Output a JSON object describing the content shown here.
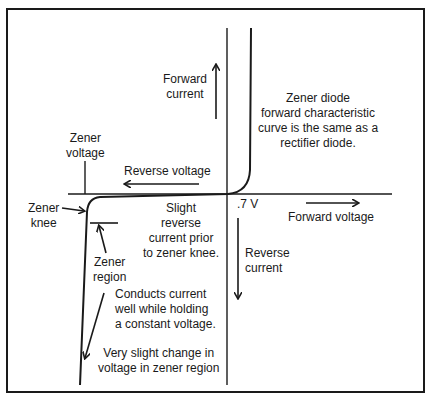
{
  "labels": {
    "forward_current": [
      "Forward",
      "current"
    ],
    "zener_voltage": [
      "Zener",
      "voltage"
    ],
    "reverse_voltage": "Reverse voltage",
    "zener_knee": [
      "Zener",
      "knee"
    ],
    "slight_reverse": [
      "Slight",
      "reverse",
      "current prior",
      "to zener knee."
    ],
    "forward_voltage_point": ".7 V",
    "forward_voltage": "Forward voltage",
    "reverse_current": [
      "Reverse",
      "current"
    ],
    "zener_region": [
      "Zener",
      "region"
    ],
    "conducts": [
      "Conducts current",
      "well while holding",
      "a constant voltage."
    ],
    "slight_change": [
      "Very slight change in",
      "voltage in zener region"
    ],
    "forward_note": [
      "Zener diode",
      "forward characteristic",
      "curve is the same as a",
      "rectifier diode."
    ]
  },
  "colors": {
    "ink": "#1a1a1a",
    "background": "#ffffff"
  }
}
